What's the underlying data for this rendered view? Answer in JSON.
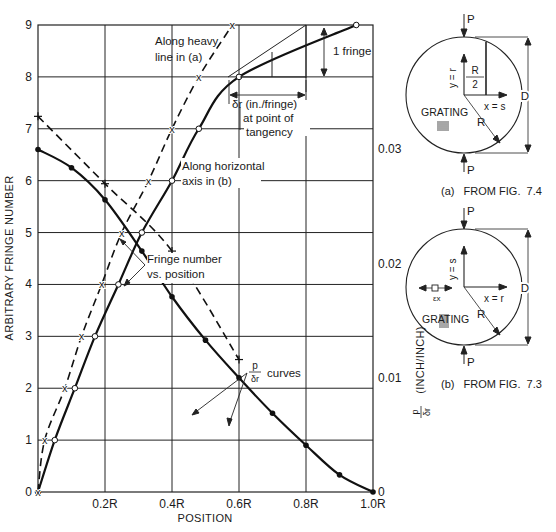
{
  "chart_data": {
    "type": "line",
    "xlabel": "POSITION",
    "ylabel": "ARBITRARY FRINGE NUMBER",
    "y2label": "(INCH/INCH)",
    "y2label_prefix": "p/δr",
    "xlim": [
      0,
      1.0
    ],
    "ylim": [
      0,
      9
    ],
    "y2lim": [
      0,
      0.0409
    ],
    "grid": true,
    "x_ticks": [
      "0.2R",
      "0.4R",
      "0.6R",
      "0.8R",
      "1.0R"
    ],
    "y_ticks": [
      "0",
      "1",
      "2",
      "3",
      "4",
      "5",
      "6",
      "7",
      "8",
      "9"
    ],
    "y2_ticks": [
      "0",
      "0.01",
      "0.02",
      "0.03"
    ],
    "series": [
      {
        "name": "Fringe number vs. position — along horizontal axis in (b)",
        "axis": "left",
        "style": "solid",
        "marker": "open-circle",
        "x": [
          0,
          0.05,
          0.11,
          0.17,
          0.24,
          0.31,
          0.4,
          0.48,
          0.6,
          0.95
        ],
        "y": [
          0,
          1,
          2,
          3,
          4,
          5,
          6,
          7,
          8,
          9
        ]
      },
      {
        "name": "Fringe number vs. position — along heavy line in (a)",
        "axis": "left",
        "style": "dashed",
        "marker": "x",
        "x": [
          0,
          0.02,
          0.08,
          0.13,
          0.19,
          0.25,
          0.33,
          0.4,
          0.48,
          0.58
        ],
        "y": [
          0,
          1,
          2,
          3,
          4,
          5,
          6,
          7,
          8,
          9
        ]
      },
      {
        "name": "p/δr curve (solid)",
        "axis": "right",
        "style": "solid",
        "marker": "filled-dot",
        "x": [
          0,
          0.1,
          0.2,
          0.31,
          0.4,
          0.5,
          0.6,
          0.7,
          0.8,
          0.9,
          1.0
        ],
        "y": [
          0.03,
          0.0284,
          0.0256,
          0.0211,
          0.0171,
          0.0133,
          0.01,
          0.0069,
          0.0041,
          0.0015,
          0
        ]
      },
      {
        "name": "p/δr curve (dashed)",
        "axis": "right",
        "style": "dashed",
        "marker": "plus",
        "x": [
          0,
          0.2,
          0.4,
          0.6
        ],
        "y": [
          0.0329,
          0.027,
          0.0211,
          0.0116
        ]
      }
    ],
    "annotations": [
      "Along heavy line in (a)",
      "Along horizontal axis in (b)",
      "Fringe number vs. position",
      "1 fringe",
      "δr (in./fringe) at point of tangency",
      "p/δr curves"
    ]
  },
  "labels": {
    "along_a_1": "Along heavy",
    "along_a_2": "line in (a)",
    "along_b_1": "Along horizontal",
    "along_b_2": "axis in (b)",
    "fringe_vs_1": "Fringe number",
    "fringe_vs_2": "vs. position",
    "one_fringe": "1 fringe",
    "delta_1": "δr (in./fringe)",
    "delta_2": "at point of",
    "delta_3": "tangency",
    "p_num": "p",
    "p_den": "δr",
    "curves": "curves"
  },
  "figures": {
    "a": {
      "caption": "(a)   FROM FIG.  7.4",
      "load": "P",
      "y_axis": "y = r",
      "x_axis": "x = s",
      "half_r_num": "R",
      "half_r_den": "2",
      "radius": "R",
      "diameter": "D",
      "grating": "GRATING"
    },
    "b": {
      "caption": "(b)   FROM FIG.  7.3",
      "load": "P",
      "y_axis": "y = s",
      "x_axis": "x = r",
      "strain": "εx",
      "radius": "R",
      "diameter": "D",
      "grating": "GRATING"
    }
  }
}
